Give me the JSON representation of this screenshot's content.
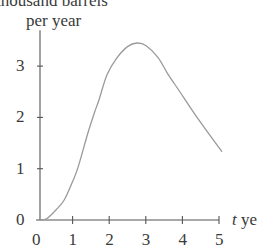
{
  "chart_data": {
    "type": "line",
    "title": "",
    "ylabel_line1": "thousand barrels",
    "ylabel_line2": "per year",
    "xlabel_var": "t",
    "xlabel_unit": "ye",
    "xlim": [
      0,
      5.2
    ],
    "ylim": [
      0,
      3.7
    ],
    "xticks": [
      "0",
      "1",
      "2",
      "3",
      "4",
      "5"
    ],
    "yticks": [
      "0",
      "1",
      "2",
      "3"
    ],
    "grid": false,
    "legend": null,
    "series": [
      {
        "name": "production rate",
        "color": "#9a9a9a",
        "x": [
          0,
          0.3,
          0.55,
          0.77,
          1.0,
          1.15,
          1.42,
          1.6,
          1.72,
          1.94,
          2.2,
          2.5,
          2.76,
          3.0,
          3.33,
          3.6,
          3.93,
          4.4,
          5.08
        ],
        "y": [
          0,
          0.03,
          0.2,
          0.39,
          0.75,
          1.03,
          1.7,
          2.1,
          2.34,
          2.83,
          3.15,
          3.38,
          3.45,
          3.4,
          3.17,
          2.85,
          2.5,
          2.0,
          1.33
        ]
      }
    ]
  }
}
